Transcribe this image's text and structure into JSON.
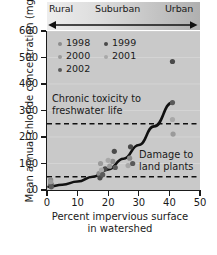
{
  "chart_data": {
    "type": "scatter",
    "title": "",
    "xlabel": "Percent impervious surface in watershed",
    "ylabel": "Mean annual chloride concentration (mg/L)",
    "xlim": [
      0,
      50
    ],
    "ylim": [
      0,
      600
    ],
    "xticks": [
      0,
      10,
      20,
      30,
      40,
      50
    ],
    "yticks": [
      0,
      100,
      200,
      300,
      400,
      500,
      600
    ],
    "grid": false,
    "plot_background": "#c9c9c9",
    "legend_position": "top-left-inside",
    "series": [
      {
        "name": "1998",
        "color": "#8c8c8c",
        "points": [
          {
            "x": 1.2,
            "y": 38
          },
          {
            "x": 17.0,
            "y": 62
          },
          {
            "x": 21.5,
            "y": 108
          },
          {
            "x": 27.0,
            "y": 120
          }
        ]
      },
      {
        "name": "1999",
        "color": "#4a4a4a",
        "points": [
          {
            "x": 1.3,
            "y": 22
          },
          {
            "x": 17.3,
            "y": 46
          },
          {
            "x": 19.0,
            "y": 80
          },
          {
            "x": 22.0,
            "y": 146
          },
          {
            "x": 27.3,
            "y": 163
          },
          {
            "x": 41.0,
            "y": 485
          }
        ]
      },
      {
        "name": "2000",
        "color": "#9a9a9a",
        "points": [
          {
            "x": 1.2,
            "y": 30
          },
          {
            "x": 17.5,
            "y": 100
          },
          {
            "x": 20.5,
            "y": 90
          },
          {
            "x": 41.2,
            "y": 211
          }
        ]
      },
      {
        "name": "2001",
        "color": "#a8a8a8",
        "points": [
          {
            "x": 17.8,
            "y": 75
          },
          {
            "x": 20.0,
            "y": 112
          },
          {
            "x": 26.5,
            "y": 92
          },
          {
            "x": 41.0,
            "y": 266
          }
        ]
      },
      {
        "name": "2002",
        "color": "#5a5a5a",
        "points": [
          {
            "x": 1.4,
            "y": 12
          },
          {
            "x": 18.2,
            "y": 58
          },
          {
            "x": 22.3,
            "y": 85
          },
          {
            "x": 28.0,
            "y": 100
          },
          {
            "x": 41.0,
            "y": 330
          }
        ]
      }
    ],
    "trend_curve": {
      "name": "fitted-trend",
      "color": "#111111",
      "points": [
        {
          "x": 0.5,
          "y": 12
        },
        {
          "x": 5,
          "y": 20
        },
        {
          "x": 10,
          "y": 32
        },
        {
          "x": 15,
          "y": 50
        },
        {
          "x": 20,
          "y": 78
        },
        {
          "x": 25,
          "y": 118
        },
        {
          "x": 30,
          "y": 170
        },
        {
          "x": 35,
          "y": 240
        },
        {
          "x": 41,
          "y": 330
        }
      ]
    },
    "threshold_lines": [
      {
        "name": "chronic-toxicity",
        "y": 250,
        "style": "dashed",
        "color": "#111111"
      },
      {
        "name": "land-plant-damage",
        "y": 50,
        "style": "dashed",
        "color": "#111111"
      }
    ],
    "annotations": [
      {
        "name": "chronic-toxicity-label",
        "lines": [
          "Chronic toxicity to",
          "freshwater life"
        ]
      },
      {
        "name": "land-plant-damage-label",
        "lines": [
          "Damage to",
          "land plants"
        ]
      }
    ],
    "gradient_band": {
      "labels": [
        "Rural",
        "Suburban",
        "Urban"
      ],
      "arrow": "double-headed"
    }
  },
  "axes": {
    "y_title": "Mean annual chloride concentration (mg/L)",
    "x_title_line1": "Percent impervious surface",
    "x_title_line2": "in watershed",
    "y_tick_labels": [
      "600",
      "500",
      "400",
      "300",
      "200",
      "100",
      "0"
    ],
    "x_tick_labels": [
      "0",
      "10",
      "20",
      "30",
      "40",
      "50"
    ]
  },
  "legend": {
    "entries": [
      {
        "label": "1998",
        "color": "#8c8c8c"
      },
      {
        "label": "1999",
        "color": "#4a4a4a"
      },
      {
        "label": "2000",
        "color": "#9a9a9a"
      },
      {
        "label": "2001",
        "color": "#a8a8a8"
      },
      {
        "label": "2002",
        "color": "#5a5a5a"
      }
    ]
  },
  "band": {
    "rural": "Rural",
    "suburban": "Suburban",
    "urban": "Urban"
  },
  "annotations": {
    "chronic_line1": "Chronic toxicity to",
    "chronic_line2": "freshwater life",
    "damage_line1": "Damage to",
    "damage_line2": "land plants"
  }
}
